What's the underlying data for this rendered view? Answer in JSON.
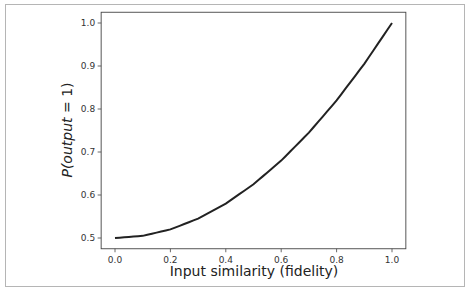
{
  "chart_data": {
    "type": "line",
    "title": "",
    "xlabel": "Input similarity (fidelity)",
    "ylabel": "P(output = 1)",
    "ylabel_parts": {
      "prefix": "P(",
      "var": "output",
      "suffix": " = 1)"
    },
    "xlim": [
      -0.05,
      1.05
    ],
    "ylim": [
      0.475,
      1.025
    ],
    "xticks": [
      0.0,
      0.2,
      0.4,
      0.6,
      0.8,
      1.0
    ],
    "xtick_labels": [
      "0.0",
      "0.2",
      "0.4",
      "0.6",
      "0.8",
      "1.0"
    ],
    "yticks": [
      0.5,
      0.6,
      0.7,
      0.8,
      0.9,
      1.0
    ],
    "ytick_labels": [
      "0.5",
      "0.6",
      "0.7",
      "0.8",
      "0.9",
      "1.0"
    ],
    "grid": false,
    "legend": null,
    "series": [
      {
        "name": "P(output=1) = 0.5 + 0.5·x²",
        "color": "#222222",
        "x": [
          0.0,
          0.1,
          0.2,
          0.3,
          0.4,
          0.5,
          0.6,
          0.7,
          0.8,
          0.9,
          1.0
        ],
        "values": [
          0.5,
          0.505,
          0.52,
          0.545,
          0.58,
          0.625,
          0.68,
          0.745,
          0.82,
          0.905,
          1.0
        ]
      }
    ]
  }
}
